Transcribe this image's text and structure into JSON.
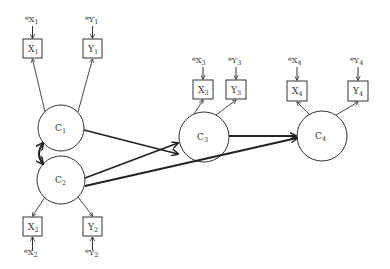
{
  "diagram": {
    "type": "path-diagram",
    "latent_constructs": [
      {
        "id": "C1",
        "label": "C",
        "sub": "1"
      },
      {
        "id": "C2",
        "label": "C",
        "sub": "2"
      },
      {
        "id": "C3",
        "label": "C",
        "sub": "3"
      },
      {
        "id": "C4",
        "label": "C",
        "sub": "4"
      }
    ],
    "indicators": [
      {
        "id": "X1",
        "label": "X",
        "sub": "1",
        "error": "e",
        "error_var": "X",
        "error_sub": "1"
      },
      {
        "id": "Y1",
        "label": "Y",
        "sub": "1",
        "error": "e",
        "error_var": "Y",
        "error_sub": "1"
      },
      {
        "id": "X2",
        "label": "X",
        "sub": "2",
        "error": "e",
        "error_var": "X",
        "error_sub": "2"
      },
      {
        "id": "Y2",
        "label": "Y",
        "sub": "2",
        "error": "e",
        "error_var": "Y",
        "error_sub": "2"
      },
      {
        "id": "X3",
        "label": "X",
        "sub": "3",
        "error": "e",
        "error_var": "X",
        "error_sub": "3"
      },
      {
        "id": "Y3",
        "label": "Y",
        "sub": "3",
        "error": "e",
        "error_var": "Y",
        "error_sub": "3"
      },
      {
        "id": "X4",
        "label": "X",
        "sub": "4",
        "error": "e",
        "error_var": "X",
        "error_sub": "4"
      },
      {
        "id": "Y4",
        "label": "Y",
        "sub": "4",
        "error": "e",
        "error_var": "Y",
        "error_sub": "4"
      }
    ],
    "edges": [
      {
        "from": "C1",
        "to": "X1",
        "kind": "loading"
      },
      {
        "from": "C1",
        "to": "Y1",
        "kind": "loading"
      },
      {
        "from": "C2",
        "to": "X2",
        "kind": "loading"
      },
      {
        "from": "C2",
        "to": "Y2",
        "kind": "loading"
      },
      {
        "from": "C3",
        "to": "X3",
        "kind": "loading"
      },
      {
        "from": "C3",
        "to": "Y3",
        "kind": "loading"
      },
      {
        "from": "C4",
        "to": "X4",
        "kind": "loading"
      },
      {
        "from": "C4",
        "to": "Y4",
        "kind": "loading"
      },
      {
        "from": "C1",
        "to": "C3",
        "kind": "causal"
      },
      {
        "from": "C2",
        "to": "C3",
        "kind": "causal"
      },
      {
        "from": "C2",
        "to": "C4",
        "kind": "causal"
      },
      {
        "from": "C3",
        "to": "C4",
        "kind": "causal"
      },
      {
        "from": "C1",
        "to": "C2",
        "kind": "correlation"
      }
    ]
  },
  "labels": {
    "c1": {
      "main": "C",
      "sub": "1"
    },
    "c2": {
      "main": "C",
      "sub": "2"
    },
    "c3": {
      "main": "C",
      "sub": "3"
    },
    "c4": {
      "main": "C",
      "sub": "4"
    },
    "x1": {
      "main": "X",
      "sub": "1"
    },
    "y1": {
      "main": "Y",
      "sub": "1"
    },
    "x2": {
      "main": "X",
      "sub": "2"
    },
    "y2": {
      "main": "Y",
      "sub": "2"
    },
    "x3": {
      "main": "X",
      "sub": "3"
    },
    "y3": {
      "main": "Y",
      "sub": "3"
    },
    "x4": {
      "main": "X",
      "sub": "4"
    },
    "y4": {
      "main": "Y",
      "sub": "4"
    },
    "ex1": {
      "e": "e",
      "main": "X",
      "sub": "1"
    },
    "ey1": {
      "e": "e",
      "main": "Y",
      "sub": "1"
    },
    "ex2": {
      "e": "e",
      "main": "X",
      "sub": "2"
    },
    "ey2": {
      "e": "e",
      "main": "Y",
      "sub": "2"
    },
    "ex3": {
      "e": "e",
      "main": "X",
      "sub": "3"
    },
    "ey3": {
      "e": "e",
      "main": "Y",
      "sub": "3"
    },
    "ex4": {
      "e": "e",
      "main": "X",
      "sub": "4"
    },
    "ey4": {
      "e": "e",
      "main": "Y",
      "sub": "4"
    }
  },
  "colors": {
    "stroke": "#333333",
    "background": "#ffffff"
  }
}
